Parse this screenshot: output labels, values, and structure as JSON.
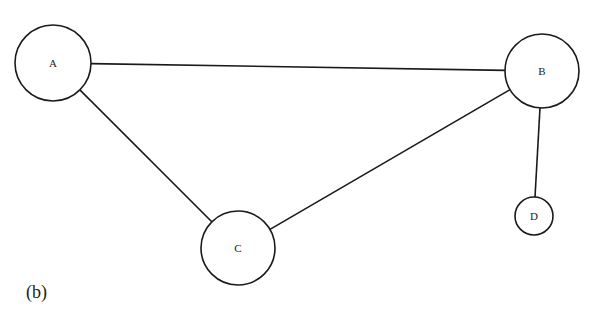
{
  "figure": {
    "caption": "(b)",
    "type": "undirected-graph"
  },
  "nodes": [
    {
      "id": "A",
      "label": "A",
      "cx": 53,
      "cy": 63,
      "r": 38
    },
    {
      "id": "B",
      "label": "B",
      "cx": 542,
      "cy": 71,
      "r": 37
    },
    {
      "id": "C",
      "label": "C",
      "cx": 238,
      "cy": 248,
      "r": 37
    },
    {
      "id": "D",
      "label": "D",
      "cx": 534,
      "cy": 216,
      "r": 19
    }
  ],
  "edges": [
    {
      "from": "A",
      "to": "B"
    },
    {
      "from": "A",
      "to": "C"
    },
    {
      "from": "C",
      "to": "B"
    },
    {
      "from": "B",
      "to": "D"
    }
  ],
  "colors": {
    "stroke": "#1a1a1a",
    "background": "#ffffff",
    "text": "#222222"
  }
}
